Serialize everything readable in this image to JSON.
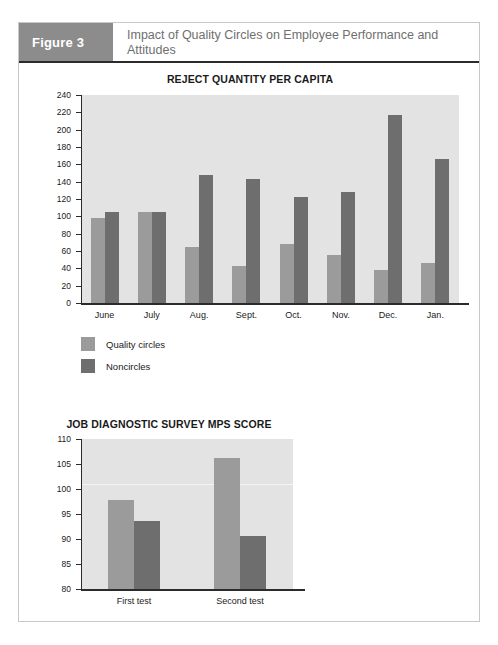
{
  "figure": {
    "number_label": "Figure 3",
    "title": "Impact of Quality Circles on Employee Performance and Attitudes"
  },
  "colors": {
    "header_block": "#8c8c8c",
    "header_title_text": "#6f6f6f",
    "plot_background": "#e3e3e3",
    "quality_circles": "#9b9b9b",
    "noncircles": "#6e6e6e",
    "axis": "#2b2b2b"
  },
  "legend": {
    "items": [
      {
        "label": "Quality circles",
        "color": "#9b9b9b",
        "swatch_name": "legend-swatch-quality-circles"
      },
      {
        "label": "Noncircles",
        "color": "#6e6e6e",
        "swatch_name": "legend-swatch-noncircles"
      }
    ]
  },
  "chart_data": [
    {
      "type": "bar",
      "title": "REJECT QUANTITY PER CAPITA",
      "xlabel": "",
      "ylabel": "",
      "ylim": [
        0,
        240
      ],
      "ytick_step": 20,
      "yticks": [
        0,
        20,
        40,
        60,
        80,
        100,
        120,
        140,
        160,
        180,
        200,
        220,
        240
      ],
      "grid": false,
      "legend_position": "below-left",
      "categories": [
        "June",
        "July",
        "Aug.",
        "Sept.",
        "Oct.",
        "Nov.",
        "Dec.",
        "Jan."
      ],
      "series": [
        {
          "name": "Quality circles",
          "color": "#9b9b9b",
          "values": [
            98,
            105,
            65,
            43,
            68,
            55,
            38,
            46
          ]
        },
        {
          "name": "Noncircles",
          "color": "#6e6e6e",
          "values": [
            105,
            105,
            148,
            143,
            122,
            128,
            217,
            166
          ]
        }
      ]
    },
    {
      "type": "bar",
      "title": "JOB DIAGNOSTIC SURVEY MPS SCORE",
      "xlabel": "",
      "ylabel": "",
      "ylim": [
        80,
        110
      ],
      "ytick_step": 5,
      "yticks": [
        80,
        85,
        90,
        95,
        100,
        105,
        110
      ],
      "grid": false,
      "legend_position": "none",
      "categories": [
        "First test",
        "Second test"
      ],
      "series": [
        {
          "name": "Quality circles",
          "color": "#9b9b9b",
          "values": [
            97.8,
            106.3
          ]
        },
        {
          "name": "Noncircles",
          "color": "#6e6e6e",
          "values": [
            93.7,
            90.6
          ]
        }
      ]
    }
  ]
}
